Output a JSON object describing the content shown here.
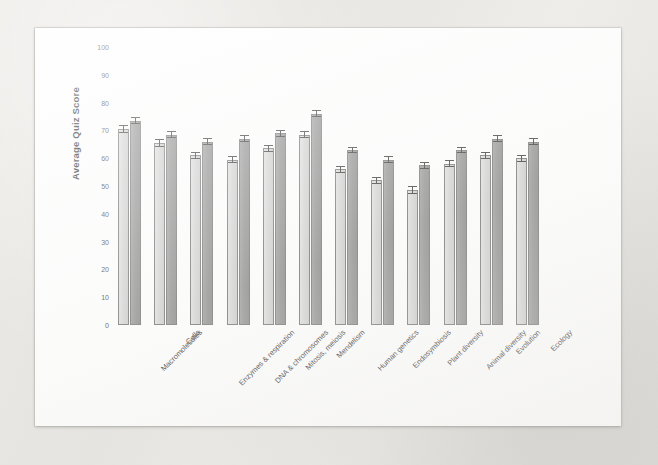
{
  "figure": {
    "background_color": "#e9e8e4",
    "page_color": "#fdfdfd",
    "ylabel": "Average Quiz Score"
  },
  "chart_data": {
    "type": "bar",
    "title": "",
    "xlabel": "",
    "ylabel": "Average Quiz Score",
    "ylim": [
      0,
      100
    ],
    "yticks": [
      0,
      10,
      20,
      30,
      40,
      50,
      60,
      70,
      80,
      90,
      100
    ],
    "grid": false,
    "legend": "none",
    "orientation": "vertical",
    "error_bars": true,
    "categories": [
      "Macromolecules",
      "Cells",
      "Enzymes & respiration",
      "DNA & chromosomes",
      "Mitosis, meiosis",
      "Mendelism",
      "Human genetics",
      "Endosymbiosis",
      "Plant diversity",
      "Animal diversity",
      "Evolution",
      "Ecology"
    ],
    "series": [
      {
        "name": "Series 1 (light)",
        "color": "#d2d2d2",
        "values": [
          70.5,
          65.5,
          61.0,
          59.5,
          63.5,
          68.5,
          56.0,
          52.0,
          48.5,
          58.0,
          61.0,
          60.0
        ],
        "errors": [
          1.3,
          1.3,
          1.2,
          1.2,
          1.2,
          1.2,
          1.3,
          1.3,
          1.4,
          1.3,
          1.3,
          1.3
        ]
      },
      {
        "name": "Series 2 (dark)",
        "color": "#8d8d8d",
        "values": [
          73.5,
          68.5,
          66.0,
          67.0,
          69.0,
          76.0,
          63.0,
          59.5,
          57.5,
          63.0,
          67.0,
          66.0
        ],
        "errors": [
          1.3,
          1.2,
          1.3,
          1.2,
          1.2,
          1.2,
          1.2,
          1.3,
          1.3,
          1.2,
          1.2,
          1.3
        ]
      }
    ]
  }
}
